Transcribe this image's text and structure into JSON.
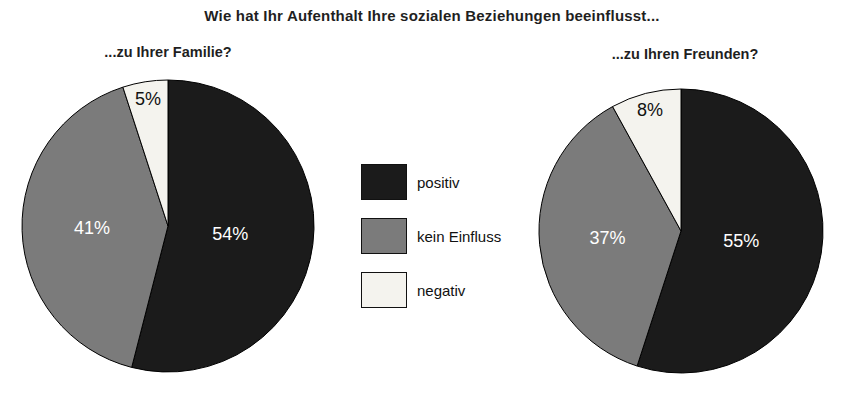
{
  "title": "Wie hat Ihr Aufenthalt Ihre sozialen Beziehungen beeinflusst...",
  "chart_data": {
    "type": "pie",
    "title": "Wie hat Ihr Aufenthalt Ihre sozialen Beziehungen beeinflusst...",
    "categories": [
      "positiv",
      "kein Einfluss",
      "negativ"
    ],
    "colors": [
      "#1b1b1b",
      "#7b7b7b",
      "#f4f3ee"
    ],
    "label_colors": [
      "#ffffff",
      "#ffffff",
      "#111111"
    ],
    "start_angle_deg": 0,
    "direction": "clockwise",
    "legend": {
      "position": "center-between-pies",
      "entries": [
        "positiv",
        "kein Einfluss",
        "negativ"
      ]
    },
    "pies": [
      {
        "id": "family",
        "title": "...zu Ihrer Familie?",
        "values": [
          54,
          41,
          5
        ],
        "labels": [
          "54%",
          "41%",
          "5%"
        ]
      },
      {
        "id": "friends",
        "title": "...zu Ihren Freunden?",
        "values": [
          55,
          37,
          8
        ],
        "labels": [
          "55%",
          "37%",
          "8%"
        ]
      }
    ]
  }
}
